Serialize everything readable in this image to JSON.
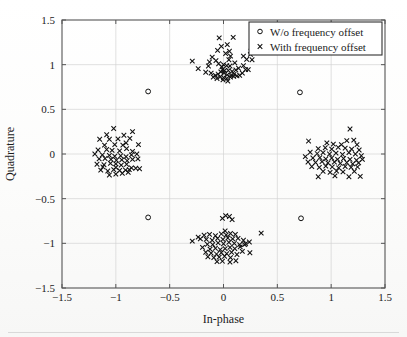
{
  "chart_data": {
    "type": "scatter",
    "title": "",
    "xlabel": "In-phase",
    "ylabel": "Quadrature",
    "xlim": [
      -1.5,
      1.5
    ],
    "ylim": [
      -1.5,
      1.5
    ],
    "xticks": [
      -1.5,
      -1,
      -0.5,
      0,
      0.5,
      1,
      1.5
    ],
    "yticks": [
      -1.5,
      -1,
      -0.5,
      0,
      0.5,
      1,
      1.5
    ],
    "xticklabels": [
      "-1.5",
      "-1",
      "-0.5",
      "0",
      "0.5",
      "1",
      "1.5"
    ],
    "yticklabels": [
      "-1.5",
      "-1",
      "-0.5",
      "0",
      "0.5",
      "1",
      "1.5"
    ],
    "grid": true,
    "legend_position": "upper-right",
    "marker_color": "#101010",
    "grid_color": "#d4d4d4",
    "axis_color": "#555555",
    "series": [
      {
        "name": "W/o frequency offset",
        "marker": "circle",
        "points": [
          [
            -0.7,
            0.7
          ],
          [
            0.71,
            0.69
          ],
          [
            -0.7,
            -0.71
          ],
          [
            0.72,
            -0.72
          ]
        ]
      },
      {
        "name": "With frequency offset",
        "marker": "x",
        "points": [
          [
            -0.04,
            1.3
          ],
          [
            0.09,
            1.305
          ],
          [
            -0.02,
            1.205
          ],
          [
            0.035,
            1.225
          ],
          [
            -0.055,
            1.16
          ],
          [
            0.055,
            1.15
          ],
          [
            0.02,
            1.125
          ],
          [
            0.065,
            1.095
          ],
          [
            -0.105,
            1.085
          ],
          [
            0.185,
            1.095
          ],
          [
            0.255,
            1.15
          ],
          [
            0.25,
            1.115
          ],
          [
            0.215,
            1.06
          ],
          [
            0.265,
            1.055
          ],
          [
            -0.29,
            1.04
          ],
          [
            -0.13,
            1.03
          ],
          [
            -0.045,
            1.01
          ],
          [
            0.0,
            1.0
          ],
          [
            0.03,
            0.99
          ],
          [
            -0.015,
            0.975
          ],
          [
            0.06,
            0.985
          ],
          [
            0.105,
            1.02
          ],
          [
            0.14,
            0.96
          ],
          [
            0.185,
            0.99
          ],
          [
            0.23,
            0.945
          ],
          [
            -0.235,
            0.955
          ],
          [
            -0.165,
            0.915
          ],
          [
            -0.115,
            0.905
          ],
          [
            -0.075,
            0.88
          ],
          [
            -0.05,
            0.895
          ],
          [
            -0.025,
            0.92
          ],
          [
            0.005,
            0.905
          ],
          [
            0.035,
            0.885
          ],
          [
            0.07,
            0.88
          ],
          [
            0.1,
            0.895
          ],
          [
            0.125,
            0.875
          ],
          [
            -0.095,
            0.86
          ],
          [
            -0.06,
            0.845
          ],
          [
            -0.03,
            0.865
          ],
          [
            0.0,
            0.855
          ],
          [
            0.03,
            0.845
          ],
          [
            0.065,
            0.86
          ],
          [
            0.095,
            0.87
          ],
          [
            0.15,
            0.88
          ],
          [
            0.01,
            0.935
          ],
          [
            -0.01,
            0.945
          ],
          [
            0.045,
            0.935
          ],
          [
            0.08,
            0.925
          ],
          [
            -0.14,
            0.985
          ],
          [
            0.175,
            0.905
          ],
          [
            0.205,
            0.945
          ],
          [
            0.05,
            1.055
          ],
          [
            -0.07,
            1.045
          ],
          [
            0.115,
            0.94
          ],
          [
            -0.005,
            0.83
          ],
          [
            0.04,
            0.815
          ],
          [
            -1.02,
            0.285
          ],
          [
            -0.845,
            0.25
          ],
          [
            -1.15,
            0.165
          ],
          [
            -1.06,
            0.165
          ],
          [
            -0.98,
            0.17
          ],
          [
            -0.905,
            0.125
          ],
          [
            -1.105,
            0.1
          ],
          [
            -1.01,
            0.105
          ],
          [
            -0.935,
            0.1
          ],
          [
            -0.79,
            0.105
          ],
          [
            -1.165,
            0.045
          ],
          [
            -1.085,
            0.05
          ],
          [
            -1.035,
            0.04
          ],
          [
            -0.965,
            0.035
          ],
          [
            -0.9,
            0.06
          ],
          [
            -0.845,
            0.03
          ],
          [
            -1.195,
            0.0
          ],
          [
            -1.125,
            -0.01
          ],
          [
            -1.06,
            -0.015
          ],
          [
            -1.01,
            -0.025
          ],
          [
            -0.955,
            -0.02
          ],
          [
            -0.905,
            -0.03
          ],
          [
            -0.855,
            -0.01
          ],
          [
            -0.805,
            0.0
          ],
          [
            -1.155,
            -0.055
          ],
          [
            -1.1,
            -0.05
          ],
          [
            -1.045,
            -0.06
          ],
          [
            -0.995,
            -0.07
          ],
          [
            -0.945,
            -0.065
          ],
          [
            -0.895,
            -0.075
          ],
          [
            -0.845,
            -0.06
          ],
          [
            -0.795,
            -0.055
          ],
          [
            -1.175,
            -0.115
          ],
          [
            -1.11,
            -0.12
          ],
          [
            -1.05,
            -0.105
          ],
          [
            -1.0,
            -0.11
          ],
          [
            -0.95,
            -0.125
          ],
          [
            -0.9,
            -0.115
          ],
          [
            -0.855,
            -0.155
          ],
          [
            -0.815,
            -0.16
          ],
          [
            -0.78,
            -0.165
          ],
          [
            -1.14,
            -0.18
          ],
          [
            -1.075,
            -0.19
          ],
          [
            -1.02,
            -0.175
          ],
          [
            -0.965,
            -0.185
          ],
          [
            -0.91,
            -0.18
          ],
          [
            -0.875,
            -0.175
          ],
          [
            -1.06,
            -0.235
          ],
          [
            -1.0,
            -0.225
          ],
          [
            -0.94,
            -0.215
          ],
          [
            -0.885,
            -0.205
          ],
          [
            -1.12,
            -0.145
          ],
          [
            -0.925,
            0.21
          ],
          [
            -1.085,
            0.215
          ],
          [
            -0.87,
            0.175
          ],
          [
            -1.0,
            -0.15
          ],
          [
            1.175,
            0.28
          ],
          [
            0.79,
            0.145
          ],
          [
            1.21,
            0.155
          ],
          [
            1.145,
            0.15
          ],
          [
            0.96,
            0.125
          ],
          [
            1.02,
            0.11
          ],
          [
            1.095,
            0.105
          ],
          [
            1.24,
            0.105
          ],
          [
            0.88,
            0.06
          ],
          [
            0.945,
            0.07
          ],
          [
            1.005,
            0.055
          ],
          [
            1.065,
            0.075
          ],
          [
            1.13,
            0.065
          ],
          [
            1.19,
            0.055
          ],
          [
            1.26,
            0.045
          ],
          [
            0.805,
            0.02
          ],
          [
            0.87,
            0.005
          ],
          [
            0.925,
            0.015
          ],
          [
            0.985,
            0.0
          ],
          [
            1.045,
            0.01
          ],
          [
            1.105,
            -0.005
          ],
          [
            1.165,
            0.015
          ],
          [
            1.225,
            0.0
          ],
          [
            1.28,
            -0.02
          ],
          [
            0.76,
            -0.03
          ],
          [
            0.83,
            -0.045
          ],
          [
            0.895,
            -0.04
          ],
          [
            0.95,
            -0.055
          ],
          [
            1.005,
            -0.045
          ],
          [
            1.06,
            -0.06
          ],
          [
            1.115,
            -0.05
          ],
          [
            1.175,
            -0.06
          ],
          [
            1.235,
            -0.07
          ],
          [
            1.29,
            -0.06
          ],
          [
            0.785,
            -0.09
          ],
          [
            0.855,
            -0.095
          ],
          [
            0.915,
            -0.085
          ],
          [
            0.97,
            -0.1
          ],
          [
            1.03,
            -0.09
          ],
          [
            1.085,
            -0.105
          ],
          [
            1.145,
            -0.095
          ],
          [
            1.2,
            -0.11
          ],
          [
            1.255,
            -0.1
          ],
          [
            0.82,
            -0.14
          ],
          [
            0.89,
            -0.15
          ],
          [
            0.95,
            -0.135
          ],
          [
            1.01,
            -0.145
          ],
          [
            1.07,
            -0.155
          ],
          [
            1.13,
            -0.14
          ],
          [
            1.185,
            -0.15
          ],
          [
            1.245,
            -0.145
          ],
          [
            0.925,
            -0.195
          ],
          [
            0.99,
            -0.205
          ],
          [
            1.05,
            -0.19
          ],
          [
            1.11,
            -0.2
          ],
          [
            0.88,
            -0.255
          ],
          [
            1.165,
            -0.255
          ],
          [
            1.27,
            -0.25
          ],
          [
            1.215,
            -0.195
          ],
          [
            1.035,
            -0.245
          ],
          [
            0.02,
            -0.69
          ],
          [
            0.055,
            -0.7
          ],
          [
            -0.01,
            -0.72
          ],
          [
            0.08,
            -0.735
          ],
          [
            -0.235,
            -0.93
          ],
          [
            -0.18,
            -0.91
          ],
          [
            -0.13,
            -0.9
          ],
          [
            -0.075,
            -0.915
          ],
          [
            -0.02,
            -0.895
          ],
          [
            0.025,
            -0.905
          ],
          [
            0.065,
            -0.89
          ],
          [
            0.11,
            -0.9
          ],
          [
            -0.29,
            -0.975
          ],
          [
            -0.215,
            -0.95
          ],
          [
            -0.16,
            -0.955
          ],
          [
            -0.105,
            -0.965
          ],
          [
            -0.055,
            -0.945
          ],
          [
            -0.005,
            -0.955
          ],
          [
            0.04,
            -0.94
          ],
          [
            0.085,
            -0.95
          ],
          [
            0.135,
            -0.945
          ],
          [
            0.185,
            -0.965
          ],
          [
            0.24,
            -0.985
          ],
          [
            0.35,
            -0.885
          ],
          [
            -0.15,
            -1.01
          ],
          [
            -0.1,
            -1.015
          ],
          [
            -0.05,
            -0.995
          ],
          [
            0.0,
            -1.005
          ],
          [
            0.05,
            -0.99
          ],
          [
            0.1,
            -1.0
          ],
          [
            0.15,
            -1.015
          ],
          [
            0.205,
            -1.005
          ],
          [
            -0.125,
            -1.065
          ],
          [
            -0.075,
            -1.055
          ],
          [
            -0.03,
            -1.07
          ],
          [
            0.015,
            -1.06
          ],
          [
            0.06,
            -1.045
          ],
          [
            0.105,
            -1.06
          ],
          [
            0.155,
            -1.04
          ],
          [
            -0.165,
            -1.1
          ],
          [
            -0.115,
            -1.11
          ],
          [
            -0.065,
            -1.12
          ],
          [
            -0.02,
            -1.105
          ],
          [
            0.03,
            -1.115
          ],
          [
            0.075,
            -1.1
          ],
          [
            0.125,
            -1.125
          ],
          [
            0.245,
            -1.105
          ],
          [
            -0.145,
            -1.15
          ],
          [
            -0.09,
            -1.16
          ],
          [
            -0.04,
            -1.155
          ],
          [
            0.01,
            -1.145
          ],
          [
            0.065,
            -1.16
          ],
          [
            0.115,
            -1.195
          ],
          [
            -0.01,
            -1.2
          ],
          [
            0.06,
            -1.21
          ],
          [
            -0.06,
            -1.205
          ],
          [
            0.175,
            -1.09
          ],
          [
            0.195,
            -1.015
          ],
          [
            -0.195,
            -1.045
          ],
          [
            0.015,
            -0.86
          ]
        ]
      }
    ]
  },
  "legend": {
    "entries": [
      {
        "marker": "circle",
        "label": "W/o frequency offset"
      },
      {
        "marker": "x",
        "label": "With frequency offset"
      }
    ]
  }
}
